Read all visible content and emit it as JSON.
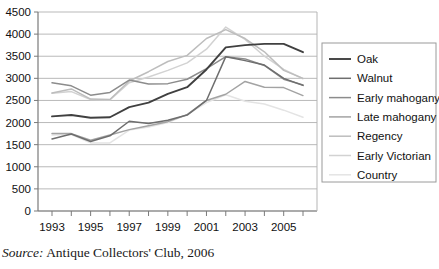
{
  "caption": {
    "label": "Source:",
    "text": "Antique Collectors' Club, 2006"
  },
  "legend": {
    "position": "right",
    "items": [
      {
        "label": "Oak",
        "color": "#404040"
      },
      {
        "label": "Walnut",
        "color": "#6e6e6e"
      },
      {
        "label": "Early mahogany",
        "color": "#8c8c8c"
      },
      {
        "label": "Late mahogany",
        "color": "#a3a3a3"
      },
      {
        "label": "Regency",
        "color": "#bdbdbd"
      },
      {
        "label": "Early Victorian",
        "color": "#d2d2d2"
      },
      {
        "label": "Country",
        "color": "#e4e4e4"
      }
    ]
  },
  "axis": {
    "y_ticks": [
      0,
      500,
      1000,
      1500,
      2000,
      2500,
      3000,
      3500,
      4000,
      4500
    ],
    "y_tick_labels": [
      "0",
      "500",
      "1000",
      "1500",
      "2000",
      "2500",
      "3000",
      "3500",
      "4000",
      "4500"
    ],
    "x_tick_labels": [
      "1993",
      "",
      "1995",
      "",
      "1997",
      "",
      "1999",
      "",
      "2001",
      "",
      "2003",
      "",
      "2005",
      ""
    ]
  },
  "chart_data": {
    "type": "line",
    "title": "",
    "xlabel": "",
    "ylabel": "",
    "ylim": [
      0,
      4500
    ],
    "grid": true,
    "legend_position": "right",
    "x": [
      1993,
      1994,
      1995,
      1996,
      1997,
      1998,
      1999,
      2000,
      2001,
      2002,
      2003,
      2004,
      2005,
      2006
    ],
    "categories": [
      "1993",
      "1994",
      "1995",
      "1996",
      "1997",
      "1998",
      "1999",
      "2000",
      "2001",
      "2002",
      "2003",
      "2004",
      "2005",
      "2006"
    ],
    "series": [
      {
        "name": "Oak",
        "color": "#404040",
        "values": [
          2140,
          2170,
          2110,
          2120,
          2350,
          2450,
          2650,
          2800,
          3200,
          3700,
          3750,
          3780,
          3780,
          3590
        ]
      },
      {
        "name": "Walnut",
        "color": "#6e6e6e",
        "values": [
          1630,
          1740,
          1570,
          1700,
          2030,
          1980,
          2050,
          2170,
          2500,
          3490,
          3400,
          3300,
          3000,
          2840
        ]
      },
      {
        "name": "Early mahogany",
        "color": "#8c8c8c",
        "values": [
          2900,
          2830,
          2620,
          2680,
          2960,
          2870,
          2880,
          2980,
          3220,
          3490,
          3440,
          3290,
          2980,
          2850
        ]
      },
      {
        "name": "Late mahogany",
        "color": "#a3a3a3",
        "values": [
          1750,
          1750,
          1600,
          1720,
          1840,
          1930,
          2020,
          2180,
          2500,
          2640,
          2930,
          2800,
          2790,
          2610
        ]
      },
      {
        "name": "Regency",
        "color": "#bdbdbd",
        "values": [
          2670,
          2760,
          2530,
          2520,
          2940,
          3150,
          3380,
          3520,
          3900,
          4100,
          3900,
          3600,
          3180,
          3000
        ]
      },
      {
        "name": "Early Victorian",
        "color": "#d2d2d2",
        "values": [
          2660,
          2700,
          2520,
          2510,
          2900,
          3030,
          3180,
          3350,
          3660,
          4160,
          3880,
          3500,
          3200,
          2990
        ]
      },
      {
        "name": "Country",
        "color": "#e4e4e4",
        "values": [
          1720,
          1730,
          1540,
          1540,
          1830,
          1900,
          2000,
          2180,
          2450,
          2630,
          2480,
          2420,
          2280,
          2120
        ]
      }
    ]
  }
}
